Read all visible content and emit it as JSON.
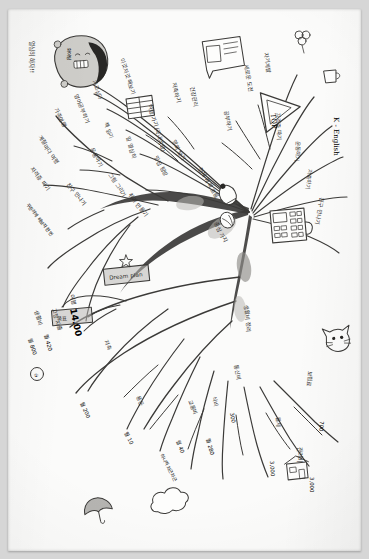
{
  "document": {
    "kind": "hand-drawn-mind-map",
    "title": "손그림 마인드맵",
    "orientation": "rotated-90-ccw",
    "medium": "pencil on white paper, photographed",
    "paper_color": "#fbfbfa",
    "background_color": "#d6d6d6",
    "ink_color": "#3b3a38",
    "highlight_color": "#b9b8b5"
  },
  "center": {
    "hub_label": "중심 가지",
    "trunk_label": "전체 계획 흐름",
    "sub_label": "생활비 정리"
  },
  "character": {
    "name": "hoodie-character-doodle",
    "caption": "열심히 하자!!",
    "badge_text": "화이팅"
  },
  "icons": [
    {
      "name": "note-icon",
      "caption": "메모장"
    },
    {
      "name": "book-icon",
      "caption": "책"
    },
    {
      "name": "play-triangle-icon",
      "caption": "TOP"
    },
    {
      "name": "calculator-icon",
      "caption": "계산기"
    },
    {
      "name": "lightbulb-icon",
      "caption": "아이디어"
    },
    {
      "name": "cat-face-icon",
      "caption": "고양이"
    },
    {
      "name": "house-icon",
      "caption": "집"
    },
    {
      "name": "cloud-icon",
      "caption": "구름"
    },
    {
      "name": "flower-icon",
      "caption": "꽃"
    },
    {
      "name": "cup-icon",
      "caption": "컵"
    },
    {
      "name": "star-icon",
      "caption": "별"
    },
    {
      "name": "umbrella-icon",
      "caption": "우산"
    },
    {
      "name": "balloon-icon",
      "caption": "풍선"
    }
  ],
  "boxes": [
    {
      "name": "highlight-box-1",
      "text": "Dream plan",
      "style": "grey-highlight"
    },
    {
      "name": "highlight-box-2",
      "text": "목표",
      "style": "grey-highlight"
    }
  ],
  "branches_upper": [
    {
      "id": "u1",
      "label": "이것저것 해보기"
    },
    {
      "id": "u2",
      "label": "가고싶다"
    },
    {
      "id": "u3",
      "label": "영어공부하기"
    },
    {
      "id": "u4",
      "label": "가족여행"
    },
    {
      "id": "u5",
      "label": "계절마다 여행"
    },
    {
      "id": "u6",
      "label": "자격증 따기"
    },
    {
      "id": "u7",
      "label": "책 읽기"
    },
    {
      "id": "u8",
      "label": "일 열심히"
    },
    {
      "id": "u9",
      "label": "운동하기"
    },
    {
      "id": "u10",
      "label": "여행 가기 (국내여행)"
    },
    {
      "id": "u11",
      "label": "저축하기"
    },
    {
      "id": "u12",
      "label": "건강관리"
    },
    {
      "id": "u13",
      "label": "그림 그리기"
    },
    {
      "id": "u14",
      "label": "취미 만들기"
    },
    {
      "id": "u15",
      "label": "친구 만나기"
    },
    {
      "id": "u16",
      "label": "맛집 탐방"
    },
    {
      "id": "u17",
      "label": "영화 보기"
    },
    {
      "id": "u18",
      "label": "공부하기"
    },
    {
      "id": "u19",
      "label": "새로운 도전"
    },
    {
      "id": "u20",
      "label": "자기계발"
    }
  ],
  "branches_lower": [
    {
      "id": "l1",
      "label": "고정 지출",
      "amount": "월 420"
    },
    {
      "id": "l2",
      "label": "생활비",
      "amount": "월 800"
    },
    {
      "id": "l3",
      "label": "저축",
      "amount": "월 200"
    },
    {
      "id": "l4",
      "label": "용돈",
      "amount": "월 10"
    },
    {
      "id": "l5",
      "label": "교통비",
      "amount": "월 40"
    },
    {
      "id": "l6",
      "label": "식비",
      "amount": "월 280"
    },
    {
      "id": "l7",
      "label": "통신비",
      "amount": "300"
    },
    {
      "id": "l8",
      "label": "보험료",
      "amount": "700"
    },
    {
      "id": "l9",
      "label": "월세",
      "amount": "3,000"
    },
    {
      "id": "l10",
      "label": "관리비",
      "amount": "3,000"
    }
  ],
  "numbers": [
    {
      "name": "headline-number",
      "value": "14.00",
      "note": "여행"
    },
    {
      "name": "total-1",
      "value": "월 420"
    },
    {
      "name": "total-2",
      "value": "월 800"
    },
    {
      "name": "total-3",
      "value": "월 200"
    },
    {
      "name": "total-4",
      "value": "월 280"
    },
    {
      "name": "total-5",
      "value": "월 10"
    },
    {
      "name": "total-6",
      "value": "월 40"
    },
    {
      "name": "total-7",
      "value": "300"
    },
    {
      "name": "total-8",
      "value": "700"
    },
    {
      "name": "total-9",
      "value": "3,000"
    },
    {
      "name": "total-10",
      "value": "3,000"
    },
    {
      "name": "circle-marker",
      "value": "①"
    }
  ],
  "latin_text": [
    {
      "name": "k-english-label",
      "value": "K - English"
    },
    {
      "name": "top-label",
      "value": "TOP"
    },
    {
      "name": "dream-label",
      "value": "Dream plan"
    }
  ],
  "side_notes": [
    {
      "name": "note-left-top",
      "value": "열심히 하자!!"
    },
    {
      "name": "note-left-mid",
      "value": "꾸준하게 해보자 한번"
    },
    {
      "name": "note-bottom",
      "value": "하나씩 차근차근"
    }
  ]
}
